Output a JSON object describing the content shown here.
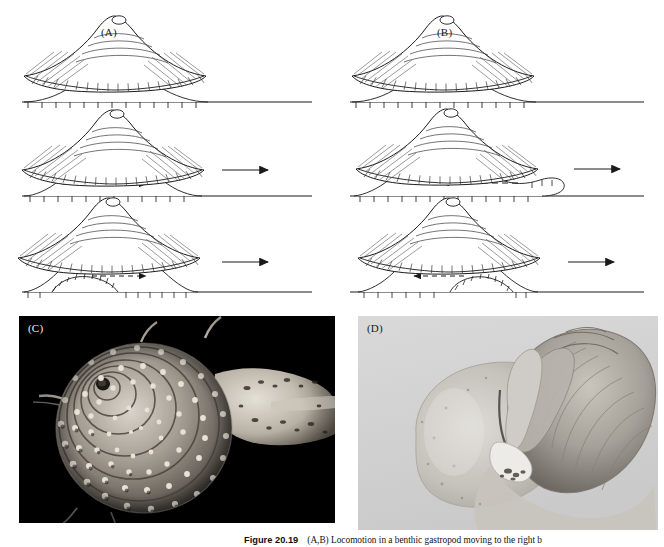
{
  "figure": {
    "label_word": "Figure",
    "number": "20.19",
    "caption_text": "(A,B) Locomotion in a benthic gastropod moving to the right b",
    "caption_full_visible": "Figure 20.19   (A,B) Locomotion in a benthic gastropod moving to the right b"
  },
  "panels": [
    {
      "id": "A",
      "label": "(A)",
      "type": "line-diagram",
      "description": "Direct (prograde) pedal wave locomotion in a benthic gastropod",
      "rows": [
        {
          "stage": 1,
          "body_arrow": "none",
          "wave_arrow": "none",
          "foot_state": "flat foot attached to substratum, sole papillae shown as tick marks"
        },
        {
          "stage": 2,
          "body_arrow": "right",
          "wave_arrow": "right",
          "wave_arrow_style": "dashed",
          "foot_state": "wave beginning at posterior end of foot"
        },
        {
          "stage": 3,
          "body_arrow": "right",
          "wave_arrow": "right",
          "wave_arrow_style": "dashed-short",
          "foot_state": "lifted arch of sole travelling forward through the foot"
        }
      ]
    },
    {
      "id": "B",
      "label": "(B)",
      "type": "line-diagram",
      "description": "Retrograde pedal wave locomotion in a benthic gastropod",
      "rows": [
        {
          "stage": 1,
          "body_arrow": "none",
          "wave_arrow": "none",
          "foot_state": "flat foot attached to substratum, sole papillae shown as tick marks"
        },
        {
          "stage": 2,
          "body_arrow": "right",
          "wave_arrow": "left",
          "wave_arrow_style": "dashed",
          "foot_state": "foot extended anteriorly, wave beginning at the anterior end"
        },
        {
          "stage": 3,
          "body_arrow": "right",
          "wave_arrow": "left",
          "wave_arrow_style": "dashed-short",
          "foot_state": "lifted arch of sole travelling backward through the foot"
        }
      ]
    },
    {
      "id": "C",
      "label": "(C)",
      "type": "photograph",
      "background": "#000000",
      "description": "Knobbed spiral gastropod shell with crawling animal, head and siphon extended to the right, photographed on a black background"
    },
    {
      "id": "D",
      "label": "(D)",
      "type": "photograph",
      "background": "#d9d9d9",
      "description": "Moon snail with greatly expanded pale foot enveloping the globose shell, photographed on a pale grey background"
    }
  ],
  "colors": {
    "page_background": "#ffffff",
    "ink": "#1a1a1a",
    "panel_c_background": "#000000",
    "panel_d_background": "#d9d9d9",
    "caption_ink": "#111111"
  }
}
